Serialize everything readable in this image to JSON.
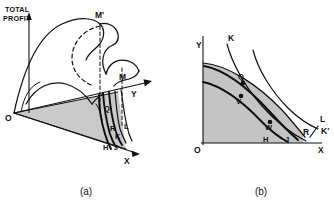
{
  "figure": {
    "width": 334,
    "height": 212,
    "background": "#ffffff",
    "ink_color": "#111111",
    "shade_color": "#c9c9c9"
  },
  "panel_a": {
    "caption": "(a)",
    "vertical_axis_label_line1": "TOTAL",
    "vertical_axis_label_line2": "PROFIT",
    "origin_label": "O",
    "axis_y_label": "Y",
    "axis_x_label": "X",
    "points": [
      {
        "label": "M'",
        "note": "global-peak-of-profit-surface"
      },
      {
        "label": "M",
        "note": "secondary-peak-of-profit-surface"
      },
      {
        "label": "Q",
        "note": "point-on-base-plane"
      },
      {
        "label": "R",
        "note": "point-on-base-plane"
      },
      {
        "label": "L",
        "note": "contour-label"
      },
      {
        "label": "K",
        "note": "contour-label"
      },
      {
        "label": "H",
        "note": "contour-label"
      },
      {
        "label": "J",
        "note": "contour-label"
      }
    ]
  },
  "panel_b": {
    "caption": "(b)",
    "axis_y_label": "Y",
    "axis_x_label": "X",
    "axis_x_prime_label": "X'",
    "origin_label": "O",
    "labels": [
      {
        "label": "K",
        "note": "upper-isoprofit-curve-top-end"
      },
      {
        "label": "K'",
        "note": "upper-isoprofit-curve-lower-end"
      },
      {
        "label": "L",
        "note": "outer-isoprofit-curve"
      },
      {
        "label": "Q",
        "note": "marked-point-upper"
      },
      {
        "label": "V",
        "note": "marked-point-middle"
      },
      {
        "label": "W",
        "note": "marked-point-lower"
      },
      {
        "label": "R",
        "note": "point-near-x-axis"
      },
      {
        "label": "H",
        "note": "inner-curve-label"
      },
      {
        "label": "J",
        "note": "inner-curve-label"
      }
    ]
  }
}
